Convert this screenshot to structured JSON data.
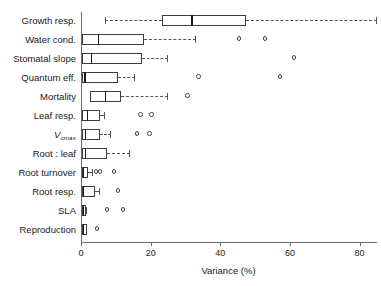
{
  "chart_data": {
    "type": "box",
    "orientation": "horizontal",
    "title": "",
    "xlabel": "Variance (%)",
    "ylabel": "",
    "xlim": [
      0,
      85
    ],
    "xticks": [
      0,
      20,
      40,
      60,
      80
    ],
    "xticklabels": [
      "0",
      "20",
      "40",
      "60",
      "80"
    ],
    "grid": false,
    "legend": null,
    "categories": [
      "Growth resp.",
      "Water cond.",
      "Stomatal slope",
      "Quantum eff.",
      "Mortality",
      "Leaf resp.",
      "Vcmax",
      "Root : leaf",
      "Root turnover",
      "Root resp.",
      "SLA",
      "Reproduction"
    ],
    "category_labels_display": [
      "Growth resp.",
      "Water cond.",
      "Stomatal slope",
      "Quantum eff.",
      "Mortality",
      "Leaf resp.",
      "V",
      "Root : leaf",
      "Root turnover",
      "Root resp.",
      "SLA",
      "Reproduction"
    ],
    "vcmax_subscript": "cmax",
    "boxes": [
      {
        "category": "Growth resp.",
        "whisker_low": 6.9,
        "q1": 23.4,
        "median": 31.7,
        "q3": 47.4,
        "whisker_high": 85.0,
        "outliers": []
      },
      {
        "category": "Water cond.",
        "whisker_low": 0.3,
        "q1": 0.3,
        "median": 4.9,
        "q3": 18.0,
        "whisker_high": 32.9,
        "outliers": [
          45.4,
          52.9
        ]
      },
      {
        "category": "Stomatal slope",
        "whisker_low": 0.3,
        "q1": 0.3,
        "median": 2.9,
        "q3": 17.4,
        "whisker_high": 25.1,
        "outliers": [
          61.1
        ]
      },
      {
        "category": "Quantum eff.",
        "whisker_low": 0.3,
        "q1": 0.3,
        "median": 0.9,
        "q3": 10.6,
        "whisker_high": 15.4,
        "outliers": [
          33.7,
          57.1
        ]
      },
      {
        "category": "Mortality",
        "whisker_low": 2.6,
        "q1": 2.6,
        "median": 6.9,
        "q3": 11.4,
        "whisker_high": 25.1,
        "outliers": [
          30.6
        ]
      },
      {
        "category": "Leaf resp.",
        "whisker_low": 0.3,
        "q1": 0.3,
        "median": 1.7,
        "q3": 5.4,
        "whisker_high": 6.9,
        "outliers": [
          17.1,
          20.3
        ]
      },
      {
        "category": "Vcmax",
        "whisker_low": 0.3,
        "q1": 0.3,
        "median": 1.1,
        "q3": 5.4,
        "whisker_high": 8.6,
        "outliers": [
          16.0,
          19.7
        ]
      },
      {
        "category": "Root : leaf",
        "whisker_low": 0.3,
        "q1": 0.3,
        "median": 1.1,
        "q3": 7.4,
        "whisker_high": 14.0,
        "outliers": []
      },
      {
        "category": "Root turnover",
        "whisker_low": 0.3,
        "q1": 0.3,
        "median": 0.6,
        "q3": 2.0,
        "whisker_high": 3.4,
        "outliers": [
          4.3,
          5.4,
          9.4
        ]
      },
      {
        "category": "Root resp.",
        "whisker_low": 0.3,
        "q1": 0.3,
        "median": 0.6,
        "q3": 4.0,
        "whisker_high": 5.4,
        "outliers": [
          10.6
        ]
      },
      {
        "category": "SLA",
        "whisker_low": 0.3,
        "q1": 0.3,
        "median": 0.6,
        "q3": 1.4,
        "whisker_high": 1.7,
        "outliers": [
          7.4,
          12.0
        ]
      },
      {
        "category": "Reproduction",
        "whisker_low": 0.3,
        "q1": 0.3,
        "median": 0.6,
        "q3": 1.7,
        "whisker_high": 1.7,
        "outliers": [
          4.6
        ]
      }
    ]
  },
  "colors": {
    "axis": "#6d6d6d",
    "box_stroke": "#3d3d3d",
    "median": "#1a1a1a",
    "whisker": "#545454",
    "outlier": "#4a4a4a",
    "background": "#ffffff",
    "text": "#1a1a1a"
  }
}
